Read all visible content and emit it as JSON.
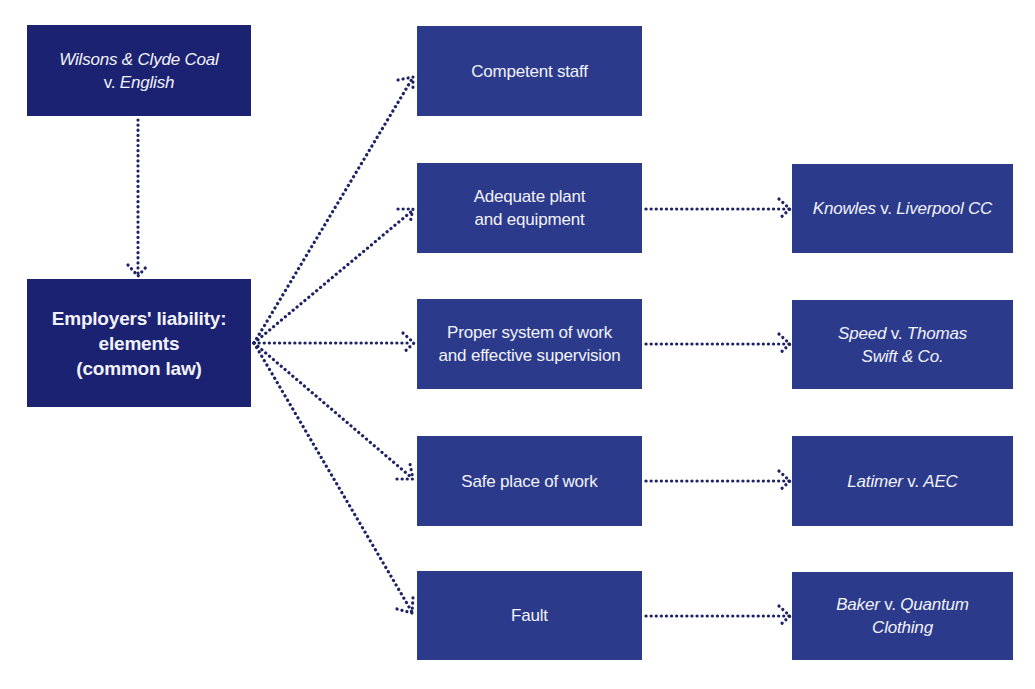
{
  "colors": {
    "primary_box": "#1c2272",
    "secondary_box": "#2b3a8a",
    "arrow": "#1c2266",
    "text": "#f2f3fa"
  },
  "source_case": {
    "line1": "Wilsons & Clyde Coal",
    "line2_plain": "v. ",
    "line2_italic": "English"
  },
  "central_node": {
    "line1": "Employers' liability:",
    "line2": "elements",
    "line3": "(common law)"
  },
  "elements": [
    {
      "line1": "Competent staff",
      "line2": ""
    },
    {
      "line1": "Adequate plant",
      "line2": "and equipment"
    },
    {
      "line1": "Proper system of work",
      "line2": "and effective supervision"
    },
    {
      "line1": "Safe place of work",
      "line2": ""
    },
    {
      "line1": "Fault",
      "line2": ""
    }
  ],
  "cases": [
    {
      "claimant": "Knowles",
      "v": " v. ",
      "defendant": "Liverpool CC",
      "defendant2": ""
    },
    {
      "claimant": "Speed",
      "v": " v. ",
      "defendant": "Thomas",
      "defendant2": "Swift & Co."
    },
    {
      "claimant": "Latimer",
      "v": " v. ",
      "defendant": "AEC",
      "defendant2": ""
    },
    {
      "claimant": "Baker",
      "v": " v. ",
      "defendant": "Quantum",
      "defendant2": "Clothing"
    }
  ]
}
